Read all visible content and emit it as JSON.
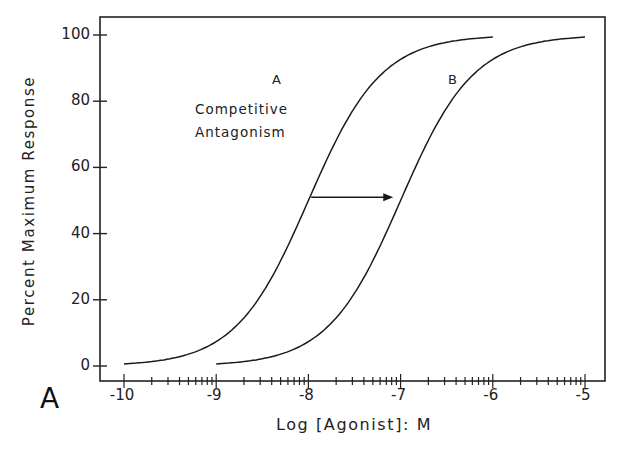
{
  "chart_data": {
    "type": "line",
    "title": "",
    "panel_label": "A",
    "xlabel": "Log [Agonist]: M",
    "ylabel": "Percent Maximum Response",
    "xlim": [
      -10.25,
      -4.8
    ],
    "ylim": [
      -4,
      106
    ],
    "x_ticks": [
      -10,
      -9,
      -8,
      -7,
      -6,
      -5
    ],
    "x_tick_labels": [
      "-10",
      "-9",
      "-8",
      "-7",
      "-6",
      "-5"
    ],
    "y_ticks": [
      0,
      20,
      40,
      60,
      80,
      100
    ],
    "y_tick_labels": [
      "0",
      "20",
      "40",
      "60",
      "80",
      "100"
    ],
    "grid": false,
    "annotation": {
      "line1": "Competitive",
      "line2": "Antagonism",
      "arrow": {
        "from": [
          -7.97,
          51
        ],
        "to": [
          -7.08,
          51
        ]
      }
    },
    "series": [
      {
        "name": "A",
        "x": [
          -10,
          -9.5,
          -9,
          -8.75,
          -8.5,
          -8.25,
          -8,
          -7.75,
          -7.5,
          -7.25,
          -7,
          -6.5,
          -6
        ],
        "values": [
          1,
          3,
          9,
          15,
          24,
          36,
          50,
          64,
          76,
          85,
          91,
          97,
          99
        ]
      },
      {
        "name": "B",
        "x": [
          -9,
          -8.5,
          -8,
          -7.75,
          -7.5,
          -7.25,
          -7,
          -6.75,
          -6.5,
          -6.25,
          -6,
          -5.5,
          -5
        ],
        "values": [
          1,
          3,
          9,
          15,
          24,
          36,
          50,
          64,
          76,
          85,
          91,
          97,
          99
        ]
      }
    ]
  },
  "labels": {
    "panel": "A",
    "ylabel": "Percent Maximum Response",
    "xlabel": "Log [Agonist]: M",
    "annotation_line1": "Competitive",
    "annotation_line2": "Antagonism",
    "curve_a": "A",
    "curve_b": "B",
    "yticks": [
      "0",
      "20",
      "40",
      "60",
      "80",
      "100"
    ],
    "xticks": [
      "-10",
      "-9",
      "-8",
      "-7",
      "-6",
      "-5"
    ]
  }
}
